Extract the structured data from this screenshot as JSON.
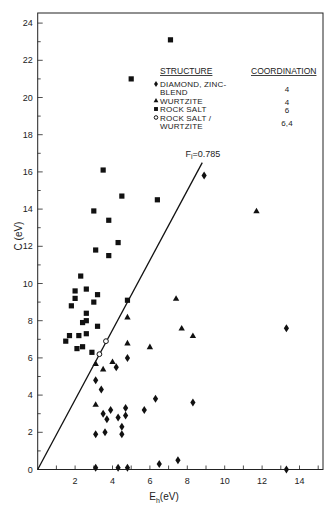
{
  "chart_data": {
    "type": "scatter",
    "title": "",
    "xlabel": "E_h (eV)",
    "ylabel": "C (eV)",
    "xlim": [
      0,
      15
    ],
    "ylim": [
      0,
      24
    ],
    "x_ticks": [
      2,
      4,
      6,
      8,
      10,
      12,
      14
    ],
    "y_ticks": [
      0,
      2,
      4,
      6,
      8,
      10,
      12,
      14,
      16,
      18,
      20,
      22,
      24
    ],
    "grid": false,
    "legend": {
      "position": "upper right",
      "headers": [
        "STRUCTURE",
        "COORDINATION"
      ],
      "entries": [
        {
          "marker": "diamond",
          "label_lines": [
            "DIAMOND, ZINC-",
            "BLEND"
          ],
          "coordination": "4"
        },
        {
          "marker": "triangle",
          "label_lines": [
            "WURTZITE"
          ],
          "coordination": "4"
        },
        {
          "marker": "square",
          "label_lines": [
            "ROCK SALT"
          ],
          "coordination": "6"
        },
        {
          "marker": "open-circle",
          "label_lines": [
            "ROCK SALT /",
            "WURTZITE"
          ],
          "coordination": "6,4"
        }
      ]
    },
    "annotations": [
      {
        "text": "F_i = 0.785",
        "label_main": "F",
        "label_sub": "i",
        "label_value": "=0.785",
        "x": 7.9,
        "y": 16.8
      }
    ],
    "reference_line": {
      "label": "F_i = 0.785",
      "x0": 0,
      "y0": 0,
      "x1": 8.8,
      "y1": 16.5
    },
    "series": [
      {
        "name": "DIAMOND, ZINC-BLEND",
        "marker": "diamond",
        "points": [
          [
            8.9,
            15.8
          ],
          [
            13.3,
            7.6
          ],
          [
            4.8,
            6.0
          ],
          [
            4.2,
            5.5
          ],
          [
            3.1,
            4.8
          ],
          [
            3.4,
            4.3
          ],
          [
            6.3,
            3.8
          ],
          [
            8.3,
            3.6
          ],
          [
            3.9,
            3.2
          ],
          [
            4.7,
            3.3
          ],
          [
            5.7,
            3.2
          ],
          [
            3.5,
            3.0
          ],
          [
            3.7,
            2.7
          ],
          [
            4.7,
            2.9
          ],
          [
            4.3,
            2.8
          ],
          [
            4.5,
            2.3
          ],
          [
            3.1,
            1.9
          ],
          [
            3.6,
            2.0
          ],
          [
            4.5,
            1.9
          ],
          [
            3.1,
            0.1
          ],
          [
            4.3,
            0.1
          ],
          [
            4.8,
            0.1
          ],
          [
            6.5,
            0.3
          ],
          [
            7.5,
            0.5
          ],
          [
            13.3,
            0.0
          ]
        ]
      },
      {
        "name": "WURTZITE",
        "marker": "triangle",
        "points": [
          [
            11.7,
            13.9
          ],
          [
            7.4,
            9.2
          ],
          [
            4.8,
            8.2
          ],
          [
            7.7,
            7.6
          ],
          [
            8.3,
            7.2
          ],
          [
            6.0,
            6.6
          ],
          [
            4.8,
            6.8
          ],
          [
            3.1,
            5.7
          ],
          [
            4.0,
            5.8
          ],
          [
            3.5,
            5.4
          ],
          [
            3.1,
            3.5
          ]
        ]
      },
      {
        "name": "ROCK SALT",
        "marker": "square",
        "points": [
          [
            7.1,
            23.1
          ],
          [
            5.0,
            21.0
          ],
          [
            3.5,
            16.1
          ],
          [
            6.4,
            14.5
          ],
          [
            4.5,
            14.7
          ],
          [
            3.0,
            13.9
          ],
          [
            3.8,
            13.4
          ],
          [
            4.3,
            12.2
          ],
          [
            3.1,
            11.8
          ],
          [
            3.8,
            11.5
          ],
          [
            2.3,
            10.4
          ],
          [
            2.0,
            9.6
          ],
          [
            2.6,
            9.7
          ],
          [
            3.2,
            9.4
          ],
          [
            2.0,
            9.2
          ],
          [
            3.0,
            9.0
          ],
          [
            1.8,
            8.8
          ],
          [
            2.6,
            8.4
          ],
          [
            2.4,
            7.9
          ],
          [
            2.6,
            8.0
          ],
          [
            3.2,
            7.7
          ],
          [
            4.8,
            9.1
          ],
          [
            1.7,
            7.2
          ],
          [
            1.5,
            6.9
          ],
          [
            2.2,
            7.2
          ],
          [
            2.6,
            7.3
          ],
          [
            2.1,
            6.5
          ],
          [
            2.4,
            6.6
          ],
          [
            2.9,
            6.3
          ]
        ]
      },
      {
        "name": "ROCK SALT / WURTZITE",
        "marker": "open-circle",
        "points": [
          [
            3.65,
            6.9
          ],
          [
            3.3,
            6.2
          ]
        ]
      }
    ]
  }
}
